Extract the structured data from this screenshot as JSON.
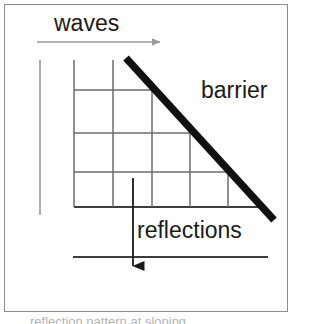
{
  "figure": {
    "labels": {
      "waves": "waves",
      "barrier": "barrier",
      "reflections": "reflections"
    },
    "clipped_caption": "reflection pattern at sloping",
    "colors": {
      "background": "#ffffff",
      "frame_border": "#8d8d8d",
      "grid_line": "#6b6b6b",
      "barrier_line": "#111111",
      "wave_arrow": "#9a9a9a",
      "reflection_arrow": "#1a1a1a",
      "baseline": "#3d3d3d",
      "text": "#1a1a1a"
    },
    "elements": {
      "wave_arrow": {
        "name": "waves-direction-arrow",
        "x1": 37,
        "y1": 42,
        "x2": 166,
        "y2": 42,
        "direction": "right"
      },
      "barrier": {
        "name": "barrier-line",
        "x1": 126,
        "y1": 58,
        "x2": 274,
        "y2": 220,
        "thickness": 7
      },
      "left_vertical": {
        "name": "left-boundary-line",
        "x1": 40,
        "y1": 60,
        "x2": 40,
        "y2": 215
      },
      "reflection_arrow": {
        "name": "reflections-direction-arrow",
        "x1": 133,
        "y1": 178,
        "x2": 133,
        "y2": 278,
        "direction": "down"
      },
      "lower_baseline": {
        "name": "lower-shore-line",
        "x1": 73,
        "y1": 257,
        "x2": 268,
        "y2": 257
      },
      "grid_baseline": {
        "name": "grid-baseline",
        "x1": 74,
        "y1": 207,
        "x2": 266,
        "y2": 207
      }
    },
    "grid": {
      "name": "wave-crest-grid",
      "origin_x": 74,
      "baseline_y": 207,
      "top_y": 60,
      "vertical_lines_x": [
        74,
        113,
        152,
        190,
        228
      ],
      "horizontal_lines_y": [
        90,
        133,
        172,
        207
      ],
      "horizontal_line_extents": [
        {
          "y": 90,
          "x1": 74,
          "x2": 155
        },
        {
          "y": 133,
          "x1": 74,
          "x2": 194
        },
        {
          "y": 172,
          "x1": 74,
          "x2": 232
        },
        {
          "y": 207,
          "x1": 74,
          "x2": 266
        }
      ],
      "vertical_line_extents": [
        {
          "x": 74,
          "y1": 60,
          "y2": 207
        },
        {
          "x": 113,
          "y1": 60,
          "y2": 207
        },
        {
          "x": 152,
          "y1": 87,
          "y2": 207
        },
        {
          "x": 190,
          "y1": 128,
          "y2": 207
        },
        {
          "x": 228,
          "y1": 170,
          "y2": 207
        }
      ]
    }
  }
}
